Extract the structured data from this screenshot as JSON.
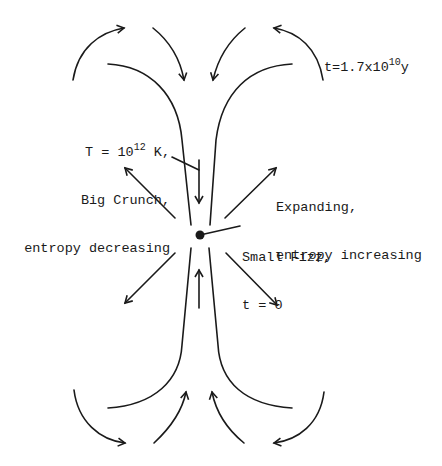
{
  "diagram": {
    "labels": {
      "time_prefix": "t=1.7x10",
      "time_exponent": "10",
      "time_suffix": "y",
      "crunch_line1_prefix": "T = 10",
      "crunch_line1_exponent": "12",
      "crunch_line1_suffix": " K,",
      "crunch_line2": "Big Crunch,",
      "crunch_line3": "entropy decreasing",
      "expanding_line1": "Expanding,",
      "expanding_line2": "entropy increasing",
      "fizz_line1": "Small Fizz,",
      "fizz_line2": "t = 0"
    },
    "colors": {
      "stroke": "#1a1a1a",
      "background": "#ffffff"
    },
    "icons": {
      "center_point": "filled-dot",
      "flow_arrows": "curved-arrows",
      "radial_arrows": "straight-arrows"
    }
  }
}
